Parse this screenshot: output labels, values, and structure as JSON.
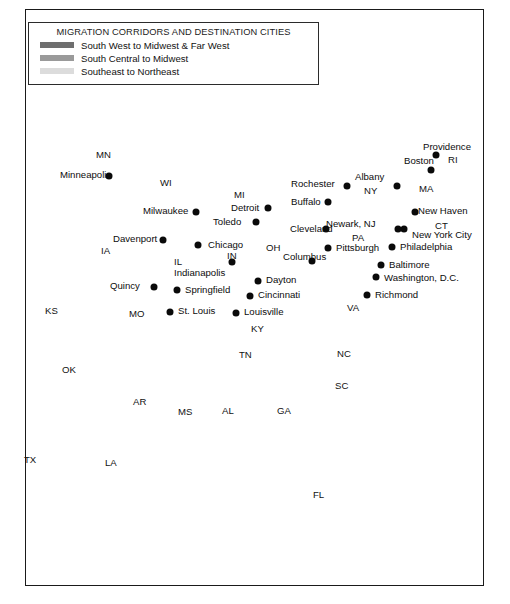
{
  "figure": {
    "kind": "thematic-map",
    "region": "Eastern and Central United States"
  },
  "legend": {
    "title": "MIGRATION CORRIDORS AND DESTINATION CITIES",
    "entries": [
      {
        "label": "South West to Midwest & Far West",
        "color": "#6e6e6e",
        "swatch_name": "swatch-south-west"
      },
      {
        "label": "South Central to Midwest",
        "color": "#9a9a9a",
        "swatch_name": "swatch-south-central"
      },
      {
        "label": "Southeast to Northeast",
        "color": "#dcdcdc",
        "swatch_name": "swatch-southeast"
      }
    ]
  },
  "colors": {
    "north_land": "#c9c9c9",
    "south_land": "#8d8d8d",
    "water": "#ffffff",
    "border_line": "#8a8a8a",
    "frame": "#1a1a1a",
    "corridor_dark": "#6e6e6e",
    "corridor_medium": "#9a9a9a",
    "corridor_light": "#e2e2e2",
    "dot": "#0a0a0a"
  },
  "cities": [
    {
      "name": "Minneapolis",
      "dot": [
        109,
        176
      ],
      "label": [
        60,
        170
      ],
      "anchor": "right"
    },
    {
      "name": "Milwaukee",
      "dot": [
        196,
        212
      ],
      "label": [
        143,
        206
      ],
      "anchor": "right"
    },
    {
      "name": "Davenport",
      "dot": [
        163,
        240
      ],
      "label": [
        113,
        234
      ],
      "anchor": "right"
    },
    {
      "name": "Chicago",
      "dot": [
        198,
        245
      ],
      "label": [
        208,
        240
      ],
      "anchor": "left"
    },
    {
      "name": "Quincy",
      "dot": [
        154,
        287
      ],
      "label": [
        110,
        281
      ],
      "anchor": "right"
    },
    {
      "name": "Springfield",
      "dot": [
        177,
        290
      ],
      "label": [
        185,
        285
      ],
      "anchor": "left"
    },
    {
      "name": "St. Louis",
      "dot": [
        170,
        312
      ],
      "label": [
        178,
        306
      ],
      "anchor": "left"
    },
    {
      "name": "Indianapolis",
      "dot": [
        232,
        262
      ],
      "label": [
        174,
        268
      ],
      "anchor": "right"
    },
    {
      "name": "Detroit",
      "dot": [
        268,
        208
      ],
      "label": [
        231,
        203
      ],
      "anchor": "right"
    },
    {
      "name": "Toledo",
      "dot": [
        256,
        222
      ],
      "label": [
        213,
        217
      ],
      "anchor": "right"
    },
    {
      "name": "Dayton",
      "dot": [
        258,
        281
      ],
      "label": [
        266,
        275
      ],
      "anchor": "left"
    },
    {
      "name": "Cincinnati",
      "dot": [
        250,
        296
      ],
      "label": [
        258,
        290
      ],
      "anchor": "left"
    },
    {
      "name": "Louisville",
      "dot": [
        236,
        313
      ],
      "label": [
        244,
        307
      ],
      "anchor": "left"
    },
    {
      "name": "Columbus",
      "dot": [
        312,
        261
      ],
      "label": [
        283,
        252
      ],
      "anchor": "left"
    },
    {
      "name": "Cleveland",
      "dot": [
        326,
        229
      ],
      "label": [
        290,
        224
      ],
      "anchor": "right"
    },
    {
      "name": "Buffalo",
      "dot": [
        328,
        202
      ],
      "label": [
        291,
        197
      ],
      "anchor": "right"
    },
    {
      "name": "Rochester",
      "dot": [
        347,
        186
      ],
      "label": [
        291,
        179
      ],
      "anchor": "right"
    },
    {
      "name": "Pittsburgh",
      "dot": [
        328,
        248
      ],
      "label": [
        336,
        243
      ],
      "anchor": "left"
    },
    {
      "name": "Albany",
      "dot": [
        397,
        186
      ],
      "label": [
        355,
        172
      ],
      "anchor": "right"
    },
    {
      "name": "Boston",
      "dot": [
        431,
        170
      ],
      "label": [
        404,
        156
      ],
      "anchor": "right"
    },
    {
      "name": "Providence",
      "dot": [
        436,
        155
      ],
      "label": [
        423,
        142
      ],
      "anchor": "left"
    },
    {
      "name": "New York City",
      "dot": [
        404,
        229
      ],
      "label": [
        412,
        230
      ],
      "anchor": "left"
    },
    {
      "name": "Newark, NJ",
      "dot": [
        398,
        229
      ],
      "label": [
        326,
        219
      ],
      "anchor": "right"
    },
    {
      "name": "New Haven",
      "dot": [
        415,
        212
      ],
      "label": [
        418,
        206
      ],
      "anchor": "left"
    },
    {
      "name": "Philadelphia",
      "dot": [
        392,
        247
      ],
      "label": [
        400,
        242
      ],
      "anchor": "left"
    },
    {
      "name": "Baltimore",
      "dot": [
        381,
        265
      ],
      "label": [
        389,
        260
      ],
      "anchor": "left"
    },
    {
      "name": "Washington, D.C.",
      "dot": [
        376,
        277
      ],
      "label": [
        384,
        273
      ],
      "anchor": "left"
    },
    {
      "name": "Richmond",
      "dot": [
        367,
        295
      ],
      "label": [
        375,
        290
      ],
      "anchor": "left"
    }
  ],
  "state_labels": [
    {
      "name": "MN",
      "pos": [
        96,
        150
      ]
    },
    {
      "name": "WI",
      "pos": [
        160,
        178
      ]
    },
    {
      "name": "IA",
      "pos": [
        101,
        246
      ]
    },
    {
      "name": "MI",
      "pos": [
        234,
        190
      ]
    },
    {
      "name": "IL",
      "pos": [
        174,
        257
      ]
    },
    {
      "name": "IN",
      "pos": [
        227,
        251
      ]
    },
    {
      "name": "OH",
      "pos": [
        266,
        243
      ]
    },
    {
      "name": "KY",
      "pos": [
        251,
        324
      ]
    },
    {
      "name": "KS",
      "pos": [
        45,
        306
      ]
    },
    {
      "name": "MO",
      "pos": [
        129,
        309
      ]
    },
    {
      "name": "OK",
      "pos": [
        62,
        365
      ]
    },
    {
      "name": "AR",
      "pos": [
        133,
        397
      ]
    },
    {
      "name": "TX",
      "pos": [
        24,
        455
      ]
    },
    {
      "name": "LA",
      "pos": [
        105,
        458
      ]
    },
    {
      "name": "MS",
      "pos": [
        178,
        407
      ]
    },
    {
      "name": "AL",
      "pos": [
        222,
        406
      ]
    },
    {
      "name": "TN",
      "pos": [
        239,
        350
      ]
    },
    {
      "name": "GA",
      "pos": [
        277,
        406
      ]
    },
    {
      "name": "FL",
      "pos": [
        313,
        490
      ]
    },
    {
      "name": "SC",
      "pos": [
        335,
        381
      ]
    },
    {
      "name": "NC",
      "pos": [
        337,
        349
      ]
    },
    {
      "name": "VA",
      "pos": [
        347,
        303
      ]
    },
    {
      "name": "PA",
      "pos": [
        352,
        233
      ]
    },
    {
      "name": "NY",
      "pos": [
        364,
        186
      ]
    },
    {
      "name": "MA",
      "pos": [
        419,
        184
      ]
    },
    {
      "name": "CT",
      "pos": [
        435,
        221
      ]
    },
    {
      "name": "RI",
      "pos": [
        448,
        155
      ]
    }
  ],
  "corridors": [
    {
      "id": "south-west-to-midwest-far-west",
      "tier": "dark",
      "color": "#6e6e6e",
      "description": "Dark corridor from Texas / Louisiana north through Oklahoma and Missouri to St. Louis, with western branches exiting toward the Far West"
    },
    {
      "id": "south-central-to-midwest",
      "tier": "medium",
      "color": "#9a9a9a",
      "description": "Medium corridor from the Mississippi delta north through Illinois and Indiana to Chicago, Milwaukee, Minneapolis, Detroit, Toledo, Cleveland and Pittsburgh"
    },
    {
      "id": "southeast-to-northeast",
      "tier": "light",
      "color": "#e2e2e2",
      "description": "Light corridor from Florida north through Georgia, South Carolina and North Carolina into Virginia and on to the Northeast"
    }
  ]
}
